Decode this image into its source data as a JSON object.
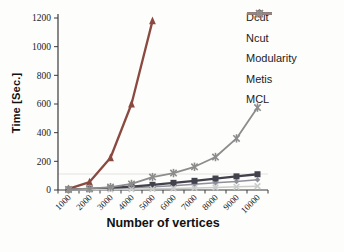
{
  "chart_data": {
    "type": "line",
    "title": "",
    "xlabel": "Number of vertices",
    "ylabel": "Time [Sec.]",
    "x_categories": [
      "1000",
      "2000",
      "3000",
      "4000",
      "5000",
      "6000",
      "7000",
      "8000",
      "9000",
      "10000"
    ],
    "y_ticks": [
      0,
      200,
      400,
      600,
      800,
      1000,
      1200
    ],
    "ylim": [
      0,
      1200
    ],
    "grid": "off",
    "legend_position": "right",
    "series": [
      {
        "name": "Dcut",
        "marker": "diamond",
        "color": "#8f8f9b",
        "values": [
          2,
          5,
          9,
          15,
          22,
          30,
          40,
          50,
          60,
          72
        ]
      },
      {
        "name": "Ncut",
        "marker": "square",
        "color": "#42424c",
        "values": [
          3,
          7,
          14,
          24,
          36,
          50,
          64,
          80,
          95,
          110
        ]
      },
      {
        "name": "Modularity",
        "marker": "triangle",
        "color": "#8b4a40",
        "values": [
          8,
          55,
          225,
          600,
          1180,
          null,
          null,
          null,
          null,
          null
        ]
      },
      {
        "name": "Metis",
        "marker": "x",
        "color": "#cbcdca",
        "values": [
          1,
          2,
          4,
          6,
          8,
          11,
          14,
          18,
          22,
          27
        ]
      },
      {
        "name": "MCL",
        "marker": "asterisk",
        "color": "#8c8c8c",
        "values": [
          4,
          9,
          20,
          42,
          90,
          118,
          162,
          230,
          360,
          575
        ]
      }
    ]
  }
}
